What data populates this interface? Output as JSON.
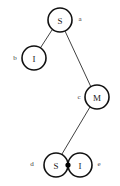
{
  "diagram": {
    "type": "tree-graph",
    "background_color": "#ffffff",
    "stroke_color": "#111111",
    "edge_color": "#2b2b2b",
    "node_fill": "#ffffff",
    "node_radius": 12,
    "node_stroke_width": 1.6,
    "edge_stroke_width": 0.9,
    "junction_dot": {
      "name": "junction-dot",
      "cx": 68,
      "cy": 165,
      "r": 2.6,
      "color": "#000000"
    },
    "nodes": [
      {
        "id": "n1",
        "label": "S",
        "side_label": "a",
        "cx": 60,
        "cy": 20,
        "side_label_x": 80,
        "side_label_y": 19
      },
      {
        "id": "n2",
        "label": "I",
        "side_label": "b",
        "cx": 34,
        "cy": 58,
        "side_label_x": 15,
        "side_label_y": 58
      },
      {
        "id": "n3",
        "label": "M",
        "side_label": "c",
        "cx": 97,
        "cy": 97,
        "side_label_x": 79,
        "side_label_y": 97
      },
      {
        "id": "n4",
        "label": "S",
        "side_label": "d",
        "cx": 56,
        "cy": 165,
        "side_label_x": 32,
        "side_label_y": 164
      },
      {
        "id": "n5",
        "label": "I",
        "side_label": "e",
        "cx": 80,
        "cy": 165,
        "side_label_x": 99,
        "side_label_y": 164
      }
    ],
    "edges": [
      {
        "id": "e1",
        "from": "n1",
        "to": "n2",
        "x1": 52,
        "y1": 30,
        "x2": 41,
        "y2": 47
      },
      {
        "id": "e2",
        "from": "n1",
        "to": "n3",
        "x1": 65,
        "y1": 31,
        "x2": 91,
        "y2": 87
      },
      {
        "id": "e3",
        "from": "n3",
        "to": "n4",
        "x1": 90,
        "y1": 107,
        "x2": 62,
        "y2": 154
      }
    ]
  }
}
